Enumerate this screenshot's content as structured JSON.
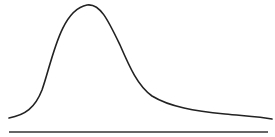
{
  "diagram": {
    "curve_type": "right-skewed distribution",
    "stroke_color": "#222222",
    "baseline_color": "#333333",
    "background_color": "#ffffff"
  }
}
